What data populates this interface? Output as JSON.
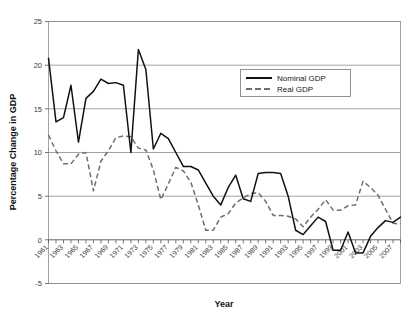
{
  "chart_data": {
    "type": "line",
    "title": "",
    "xlabel": "Year",
    "ylabel": "Percentage Change in GDP",
    "ylim": [
      -5,
      25
    ],
    "xlim": [
      1961,
      2008
    ],
    "ytick_values": [
      25,
      20,
      15,
      10,
      5,
      0,
      -5
    ],
    "ytick_labels": [
      "25",
      "20",
      "15",
      "10",
      "5",
      "0",
      "-5"
    ],
    "xtick_labels": [
      "1961",
      "1963",
      "1965",
      "1967",
      "1969",
      "1971",
      "1973",
      "1975",
      "1977",
      "1979",
      "1981",
      "1983",
      "1985",
      "1987",
      "1989",
      "1991",
      "1993",
      "1995",
      "1997",
      "1999",
      "2001",
      "2003",
      "2005",
      "2007"
    ],
    "xtick_rotation_degrees": 45,
    "minor_xticks_every_year": true,
    "grid": "horizontal",
    "legend_position": "upper-right",
    "x": [
      1961,
      1962,
      1963,
      1964,
      1965,
      1966,
      1967,
      1968,
      1969,
      1970,
      1971,
      1972,
      1973,
      1974,
      1975,
      1976,
      1977,
      1978,
      1979,
      1980,
      1981,
      1982,
      1983,
      1984,
      1985,
      1986,
      1987,
      1988,
      1989,
      1990,
      1991,
      1992,
      1993,
      1994,
      1995,
      1996,
      1997,
      1998,
      1999,
      2000,
      2001,
      2002,
      2003,
      2004,
      2005,
      2006,
      2007,
      2008
    ],
    "series": [
      {
        "name": "Nominal GDP",
        "color": "#111111",
        "style": "solid",
        "values": [
          20.8,
          13.5,
          14.0,
          17.7,
          11.2,
          16.2,
          17.0,
          18.4,
          17.9,
          18.0,
          17.7,
          10.0,
          21.8,
          19.5,
          10.4,
          12.2,
          11.6,
          10.0,
          8.4,
          8.4,
          8.0,
          6.5,
          5.0,
          4.0,
          6.0,
          7.4,
          4.7,
          4.4,
          7.6,
          7.7,
          7.7,
          7.6,
          5.0,
          1.1,
          0.6,
          1.6,
          2.6,
          2.1,
          -1.2,
          -1.2,
          0.9,
          -1.5,
          -1.5,
          0.4,
          1.4,
          2.2,
          2.0,
          2.6
        ]
      },
      {
        "name": "Real GDP",
        "color": "#6e6e6e",
        "style": "dashed",
        "values": [
          12.0,
          10.2,
          8.7,
          8.7,
          9.8,
          10.0,
          5.6,
          9.0,
          10.2,
          11.7,
          11.9,
          11.8,
          10.5,
          10.3,
          8.0,
          4.6,
          6.4,
          8.3,
          7.9,
          6.6,
          4.0,
          1.1,
          1.1,
          2.6,
          3.0,
          4.2,
          4.8,
          5.3,
          5.4,
          4.4,
          2.8,
          2.8,
          2.7,
          2.4,
          1.5,
          2.6,
          3.5,
          4.6,
          3.4,
          3.4,
          3.9,
          4.0,
          6.7,
          6.0,
          5.1,
          3.5,
          1.9,
          1.8
        ]
      }
    ],
    "series_right_real": [
      2.0,
      2.4,
      1.2,
      1.9,
      2.9,
      3.4,
      2.8,
      1.5,
      2.2,
      0.4,
      0.4,
      2.6,
      2.6,
      2.2,
      2.7
    ]
  },
  "legend": {
    "items": [
      {
        "label": "Nominal GDP",
        "color": "#111111",
        "style": "solid"
      },
      {
        "label": "Real GDP",
        "color": "#6e6e6e",
        "style": "dashed"
      }
    ]
  },
  "axes": {
    "x_title": "Year",
    "y_title": "Percentage Change in GDP"
  }
}
